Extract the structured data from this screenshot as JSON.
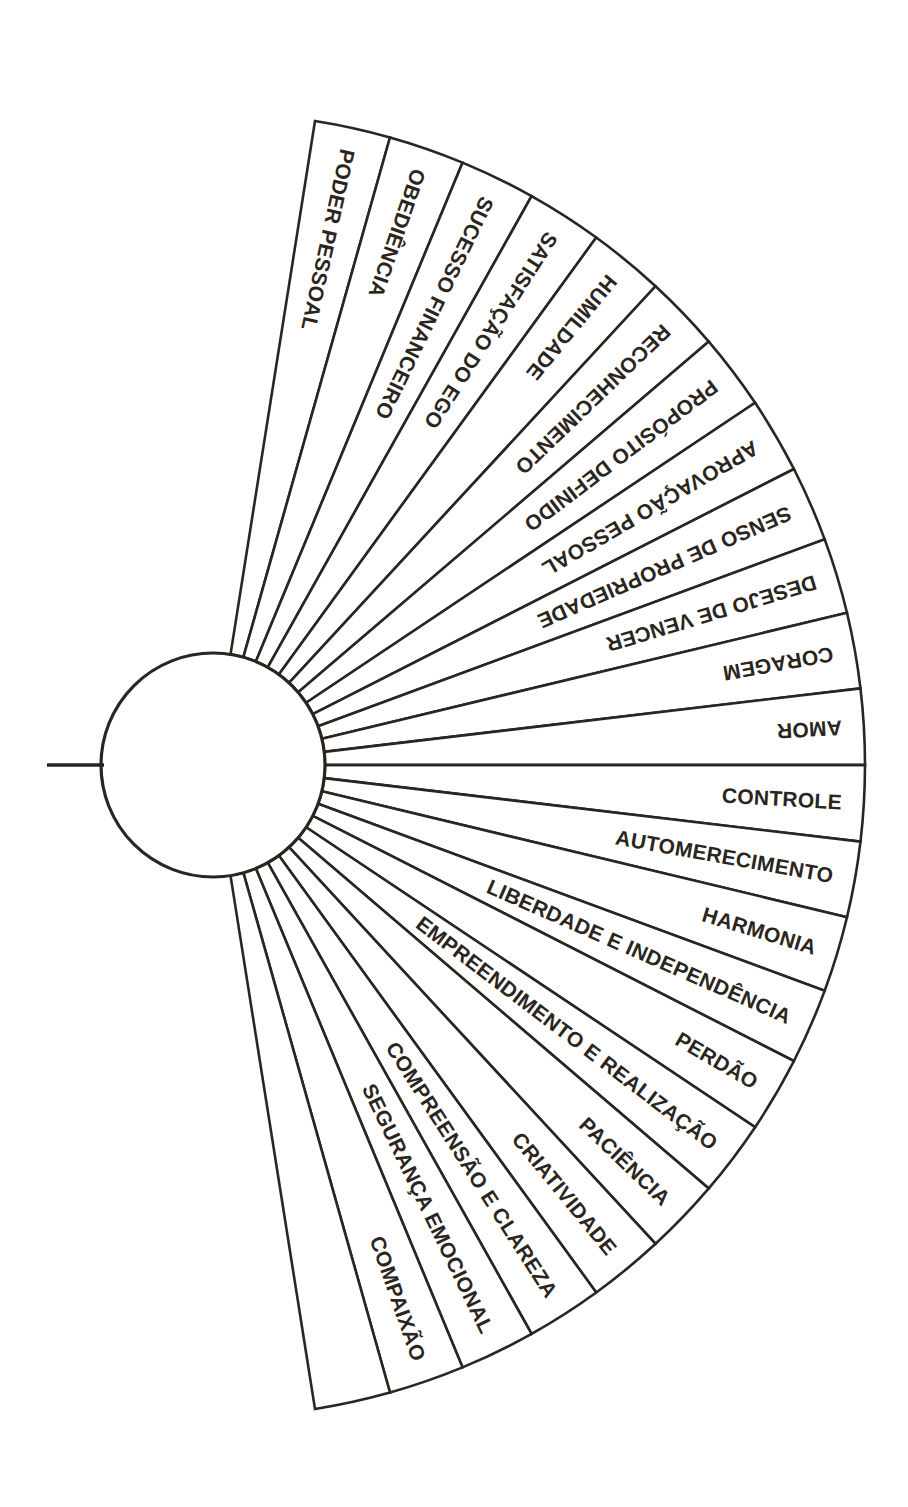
{
  "diagram": {
    "type": "radial-fan-wheel",
    "geometry": {
      "center_x": 213,
      "center_y": 765,
      "hub_radius": 112,
      "outer_radius": 652,
      "segment_count": 24,
      "half_span_degrees": 81,
      "segment_angle_degrees": 6.75
    },
    "colors": {
      "ink": "#2b2520",
      "background": "#ffffff"
    },
    "pointer": {
      "name": "pointer-line",
      "x_start": 47,
      "x_end": 104,
      "y": 765
    },
    "segments": [
      {
        "index": 0,
        "label": "PODER PESSOAL",
        "orientation": "inverted"
      },
      {
        "index": 1,
        "label": "OBEDIÊNCIA",
        "orientation": "inverted"
      },
      {
        "index": 2,
        "label": "SUCESSO FINANCEIRO",
        "orientation": "inverted"
      },
      {
        "index": 3,
        "label": "SATISFAÇÃO DO EGO",
        "orientation": "inverted"
      },
      {
        "index": 4,
        "label": "HUMILDADE",
        "orientation": "inverted"
      },
      {
        "index": 5,
        "label": "RECONHECIMENTO",
        "orientation": "inverted"
      },
      {
        "index": 6,
        "label": "PROPÓSITO DEFINIDO",
        "orientation": "inverted"
      },
      {
        "index": 7,
        "label": "APROVAÇÃO PESSOAL",
        "orientation": "inverted"
      },
      {
        "index": 8,
        "label": "SENSO DE PROPRIEDADE",
        "orientation": "inverted"
      },
      {
        "index": 9,
        "label": "DESEJO DE VENCER",
        "orientation": "inverted"
      },
      {
        "index": 10,
        "label": "CORAGEM",
        "orientation": "inverted"
      },
      {
        "index": 11,
        "label": "AMOR",
        "orientation": "inverted"
      },
      {
        "index": 12,
        "label": "CONTROLE",
        "orientation": "upright"
      },
      {
        "index": 13,
        "label": "AUTOMERECIMENTO",
        "orientation": "upright"
      },
      {
        "index": 14,
        "label": "HARMONIA",
        "orientation": "upright"
      },
      {
        "index": 15,
        "label": "LIBERDADE E INDEPENDÊNCIA",
        "orientation": "upright"
      },
      {
        "index": 16,
        "label": "PERDÃO",
        "orientation": "upright"
      },
      {
        "index": 17,
        "label": "EMPREENDIMENTO E REALIZAÇÃO",
        "orientation": "upright"
      },
      {
        "index": 18,
        "label": "PACIÊNCIA",
        "orientation": "upright"
      },
      {
        "index": 19,
        "label": "CRIATIVIDADE",
        "orientation": "upright"
      },
      {
        "index": 20,
        "label": "COMPREENSÃO E CLAREZA",
        "orientation": "upright"
      },
      {
        "index": 21,
        "label": "SEGURANÇA EMOCIONAL",
        "orientation": "upright"
      },
      {
        "index": 22,
        "label": "COMPAIXÃO",
        "orientation": "upright"
      },
      {
        "index": 23,
        "label": "",
        "orientation": "upright"
      }
    ]
  }
}
